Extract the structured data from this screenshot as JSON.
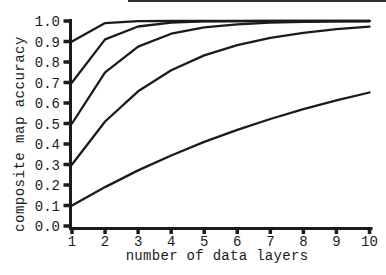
{
  "figure": {
    "background": "#ffffff",
    "ink": "#1b1b1b",
    "top_border_color": "#2f2f2f"
  },
  "chart_data": {
    "type": "line",
    "title": "",
    "xlabel": "number of data layers",
    "ylabel": "composite map accuracy",
    "xlim": [
      1,
      10
    ],
    "ylim": [
      0.0,
      1.0
    ],
    "x": [
      1,
      2,
      3,
      4,
      5,
      6,
      7,
      8,
      9,
      10
    ],
    "x_tick_labels": [
      "1",
      "2",
      "3",
      "4",
      "5",
      "6",
      "7",
      "8",
      "9",
      "10"
    ],
    "y_tick_labels": [
      "0.0",
      "0.1",
      "0.2",
      "0.3",
      "0.4",
      "0.5",
      "0.6",
      "0.7",
      "0.8",
      "0.9",
      "1.0"
    ],
    "grid": false,
    "legend_position": "none",
    "line_color": "#1b1b1b",
    "series": [
      {
        "name": "curve starting at 0.9",
        "values": [
          0.9,
          0.99,
          0.999,
          1.0,
          1.0,
          1.0,
          1.0,
          1.0,
          1.0,
          1.0
        ]
      },
      {
        "name": "curve starting at 0.7",
        "values": [
          0.7,
          0.91,
          0.973,
          0.992,
          0.998,
          0.999,
          1.0,
          1.0,
          1.0,
          1.0
        ]
      },
      {
        "name": "curve starting at 0.5",
        "values": [
          0.5,
          0.75,
          0.875,
          0.938,
          0.969,
          0.984,
          0.992,
          0.996,
          0.998,
          0.999
        ]
      },
      {
        "name": "curve starting at 0.3",
        "values": [
          0.3,
          0.51,
          0.657,
          0.76,
          0.832,
          0.882,
          0.918,
          0.942,
          0.96,
          0.972
        ]
      },
      {
        "name": "curve starting at 0.1",
        "values": [
          0.1,
          0.19,
          0.271,
          0.344,
          0.41,
          0.469,
          0.522,
          0.57,
          0.613,
          0.651
        ]
      }
    ]
  }
}
